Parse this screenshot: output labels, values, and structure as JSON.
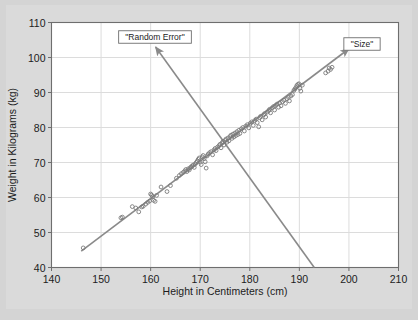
{
  "figure": {
    "background_color": "#d4d4d4",
    "plot_background_color": "#ffffff",
    "frame_color": "#6e6e6e",
    "grid_color": "#dcdcdc",
    "marker_color": "#7a7a7a",
    "arrow_color": "#8a8a8a",
    "text_color": "#1c1c1c"
  },
  "chart_data": {
    "type": "scatter",
    "title": "",
    "xlabel": "Height in Centimeters (cm)",
    "ylabel": "Weight in Kilograms (kg)",
    "xlim": [
      140,
      210
    ],
    "ylim": [
      40,
      110
    ],
    "xticks": [
      140,
      150,
      160,
      170,
      180,
      190,
      200,
      210
    ],
    "yticks": [
      40,
      50,
      60,
      70,
      80,
      90,
      100,
      110
    ],
    "xtick_labels": [
      "140",
      "150",
      "160",
      "170",
      "180",
      "190",
      "200",
      "210"
    ],
    "ytick_labels": [
      "40",
      "50",
      "60",
      "70",
      "80",
      "90",
      "100",
      "110"
    ],
    "grid": true,
    "legend": false,
    "marker": "open-circle",
    "series": [
      {
        "name": "height-weight observations",
        "points": [
          [
            146.4,
            45.6
          ],
          [
            154.0,
            54.2
          ],
          [
            154.3,
            54.4
          ],
          [
            156.3,
            57.4
          ],
          [
            157.0,
            57.0
          ],
          [
            157.6,
            55.9
          ],
          [
            158.2,
            57.3
          ],
          [
            158.5,
            57.5
          ],
          [
            159.0,
            58.1
          ],
          [
            159.4,
            58.6
          ],
          [
            159.8,
            59.0
          ],
          [
            160.0,
            61.0
          ],
          [
            160.2,
            60.7
          ],
          [
            160.4,
            60.2
          ],
          [
            160.6,
            59.2
          ],
          [
            160.9,
            58.9
          ],
          [
            161.2,
            60.6
          ],
          [
            162.1,
            63.0
          ],
          [
            163.3,
            61.7
          ],
          [
            164.0,
            63.4
          ],
          [
            165.2,
            65.5
          ],
          [
            165.8,
            66.3
          ],
          [
            166.2,
            66.8
          ],
          [
            166.6,
            67.2
          ],
          [
            166.9,
            67.6
          ],
          [
            167.1,
            68.0
          ],
          [
            167.3,
            67.4
          ],
          [
            167.6,
            68.2
          ],
          [
            167.8,
            67.9
          ],
          [
            168.0,
            68.5
          ],
          [
            168.2,
            68.8
          ],
          [
            168.4,
            69.0
          ],
          [
            168.6,
            69.3
          ],
          [
            168.8,
            68.6
          ],
          [
            169.0,
            69.6
          ],
          [
            169.2,
            70.0
          ],
          [
            169.4,
            70.4
          ],
          [
            169.6,
            70.9
          ],
          [
            169.8,
            71.3
          ],
          [
            170.0,
            70.1
          ],
          [
            170.2,
            69.4
          ],
          [
            170.4,
            71.6
          ],
          [
            170.6,
            72.0
          ],
          [
            170.8,
            71.1
          ],
          [
            171.0,
            70.2
          ],
          [
            171.2,
            68.4
          ],
          [
            171.4,
            71.9
          ],
          [
            171.6,
            72.4
          ],
          [
            171.9,
            72.8
          ],
          [
            172.2,
            73.1
          ],
          [
            172.5,
            72.2
          ],
          [
            172.8,
            73.6
          ],
          [
            173.0,
            74.0
          ],
          [
            173.2,
            73.4
          ],
          [
            173.5,
            74.4
          ],
          [
            173.8,
            74.8
          ],
          [
            174.0,
            75.2
          ],
          [
            174.2,
            74.2
          ],
          [
            174.4,
            75.6
          ],
          [
            174.6,
            76.0
          ],
          [
            174.8,
            75.0
          ],
          [
            175.0,
            76.3
          ],
          [
            175.2,
            76.7
          ],
          [
            175.4,
            75.8
          ],
          [
            175.6,
            77.0
          ],
          [
            175.8,
            76.2
          ],
          [
            176.0,
            77.4
          ],
          [
            176.2,
            77.8
          ],
          [
            176.4,
            76.9
          ],
          [
            176.6,
            78.1
          ],
          [
            176.8,
            77.3
          ],
          [
            177.0,
            78.4
          ],
          [
            177.2,
            77.7
          ],
          [
            177.4,
            78.8
          ],
          [
            177.6,
            78.0
          ],
          [
            177.8,
            79.2
          ],
          [
            178.0,
            78.3
          ],
          [
            178.3,
            79.6
          ],
          [
            178.6,
            80.0
          ],
          [
            178.9,
            79.0
          ],
          [
            179.2,
            80.4
          ],
          [
            179.5,
            80.8
          ],
          [
            179.8,
            79.9
          ],
          [
            180.1,
            81.2
          ],
          [
            180.4,
            81.6
          ],
          [
            180.7,
            80.6
          ],
          [
            181.0,
            82.0
          ],
          [
            181.3,
            82.4
          ],
          [
            181.5,
            81.4
          ],
          [
            181.8,
            80.2
          ],
          [
            182.0,
            82.8
          ],
          [
            182.2,
            83.2
          ],
          [
            182.5,
            82.2
          ],
          [
            182.8,
            83.6
          ],
          [
            183.0,
            84.0
          ],
          [
            183.2,
            83.0
          ],
          [
            183.5,
            84.4
          ],
          [
            183.8,
            84.8
          ],
          [
            184.0,
            85.2
          ],
          [
            184.2,
            84.2
          ],
          [
            184.5,
            85.6
          ],
          [
            184.8,
            86.0
          ],
          [
            185.0,
            85.0
          ],
          [
            185.2,
            86.3
          ],
          [
            185.5,
            86.7
          ],
          [
            185.8,
            85.8
          ],
          [
            186.0,
            87.0
          ],
          [
            186.3,
            86.2
          ],
          [
            186.6,
            87.4
          ],
          [
            186.9,
            87.8
          ],
          [
            187.2,
            86.9
          ],
          [
            187.5,
            88.2
          ],
          [
            187.8,
            88.6
          ],
          [
            188.0,
            87.6
          ],
          [
            188.3,
            89.0
          ],
          [
            188.6,
            89.4
          ],
          [
            188.9,
            90.6
          ],
          [
            189.1,
            91.0
          ],
          [
            189.3,
            91.4
          ],
          [
            189.5,
            92.0
          ],
          [
            189.7,
            92.3
          ],
          [
            189.9,
            92.5
          ],
          [
            190.1,
            91.2
          ],
          [
            190.3,
            90.4
          ],
          [
            190.6,
            92.1
          ],
          [
            195.3,
            95.6
          ],
          [
            195.8,
            96.1
          ],
          [
            196.0,
            97.0
          ],
          [
            196.3,
            96.6
          ],
          [
            196.6,
            97.2
          ]
        ]
      }
    ],
    "annotations": [
      {
        "id": "size",
        "label": "\"Size\"",
        "box": true,
        "arrow": {
          "from": [
            146,
            44.7
          ],
          "to": [
            200,
            102.5
          ],
          "double_headed": false,
          "description": "arrow along the direction of maximum variance (positive trend)"
        }
      },
      {
        "id": "random-error",
        "label": "\"Random Error\"",
        "box": true,
        "arrow": {
          "from": [
            193,
            40
          ],
          "to": [
            161,
            103
          ],
          "double_headed": false,
          "description": "arrow perpendicular to the trend line representing residual scatter"
        }
      }
    ]
  }
}
